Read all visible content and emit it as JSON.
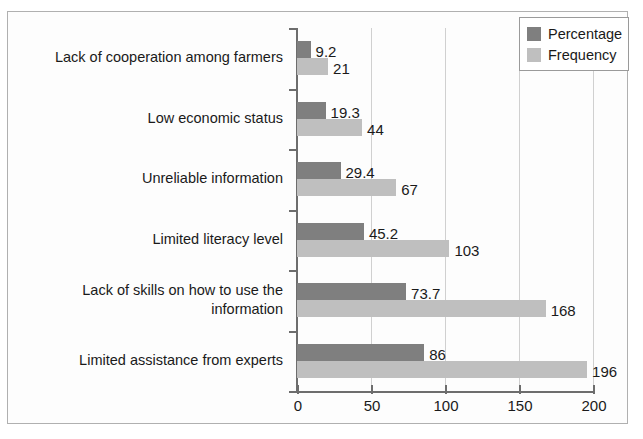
{
  "chart_data": {
    "type": "bar",
    "orientation": "horizontal",
    "title": "",
    "xlabel": "",
    "ylabel": "",
    "xlim": [
      0,
      200
    ],
    "xticks": [
      0,
      50,
      100,
      150,
      200
    ],
    "xtick_labels": [
      "0",
      "50",
      "100",
      "150",
      "200"
    ],
    "grid": true,
    "legend_position": "top-right",
    "categories": [
      "Lack of cooperation among farmers",
      "Low economic status",
      "Unreliable information",
      "Limited literacy level",
      "Lack of skills on how to use the\ninformation",
      "Limited assistance from experts"
    ],
    "series": [
      {
        "name": "Percentage",
        "color": "#7f7f7f",
        "values": [
          9.2,
          19.3,
          29.4,
          45.2,
          73.7,
          86
        ],
        "labels": [
          "9.2",
          "19.3",
          "29.4",
          "45.2",
          "73.7",
          "86"
        ]
      },
      {
        "name": "Frequency",
        "color": "#bfbfbf",
        "values": [
          21,
          44,
          67,
          103,
          168,
          196
        ],
        "labels": [
          "21",
          "44",
          "67",
          "103",
          "168",
          "196"
        ]
      }
    ]
  },
  "legend": {
    "items": [
      {
        "label": "Percentage",
        "color": "#7f7f7f"
      },
      {
        "label": "Frequency",
        "color": "#bfbfbf"
      }
    ]
  }
}
